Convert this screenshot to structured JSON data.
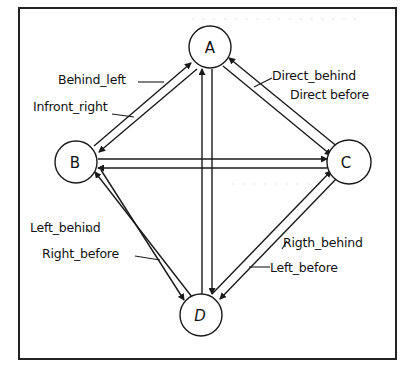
{
  "diagram": {
    "nodes": [
      {
        "id": "A",
        "label": "A",
        "cx": 210,
        "cy": 47,
        "r": 21
      },
      {
        "id": "B",
        "label": "B",
        "cx": 76,
        "cy": 162,
        "r": 21
      },
      {
        "id": "C",
        "label": "C",
        "cx": 349,
        "cy": 162,
        "r": 22
      },
      {
        "id": "D",
        "label": "D",
        "cx": 201,
        "cy": 315,
        "r": 21
      }
    ],
    "edges": [
      {
        "from": "B",
        "to": "A",
        "label": "Behind_left"
      },
      {
        "from": "A",
        "to": "B",
        "label": "Infront_right"
      },
      {
        "from": "C",
        "to": "A",
        "label": "Direct_behind"
      },
      {
        "from": "A",
        "to": "C",
        "label": "Direct before"
      },
      {
        "from": "B",
        "to": "C",
        "label": ""
      },
      {
        "from": "C",
        "to": "B",
        "label": ""
      },
      {
        "from": "D",
        "to": "A",
        "label": ""
      },
      {
        "from": "A",
        "to": "D",
        "label": ""
      },
      {
        "from": "D",
        "to": "B",
        "label": "Left_behind"
      },
      {
        "from": "B",
        "to": "D",
        "label": "Right_before"
      },
      {
        "from": "D",
        "to": "C",
        "label": "Rigth_behind"
      },
      {
        "from": "C",
        "to": "D",
        "label": "Left_before"
      }
    ],
    "labels": {
      "behind_left": "Behind_left",
      "infront_right": "Infront_right",
      "direct_behind": "Direct_behind",
      "direct_before": "Direct before",
      "left_behind": "Left_behind",
      "right_before": "Right_before",
      "rigth_behind": "Rigth_behind",
      "left_before": "Left_before"
    },
    "node_labels": {
      "A": "A",
      "B": "B",
      "C": "C",
      "D": "D"
    },
    "colors": {
      "stroke": "#1a1a1a",
      "background": "#ffffff"
    }
  }
}
